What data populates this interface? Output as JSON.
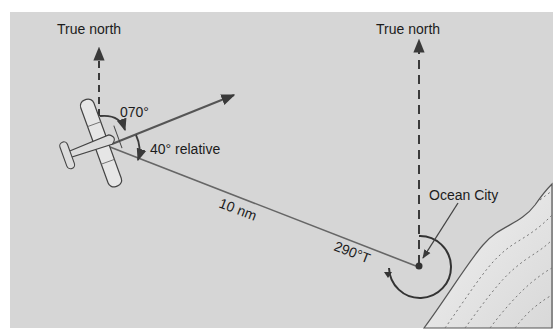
{
  "diagram": {
    "labels": {
      "true_north_left": "True north",
      "true_north_right": "True north",
      "heading": "070°",
      "relative_bearing": "40° relative",
      "distance": "10 nm",
      "station": "Ocean City",
      "true_bearing": "290°T"
    },
    "colors": {
      "background": "#d6d6d6",
      "line": "#4a4a4a",
      "text": "#1c1c1c",
      "land": "#e8e8e8"
    }
  }
}
